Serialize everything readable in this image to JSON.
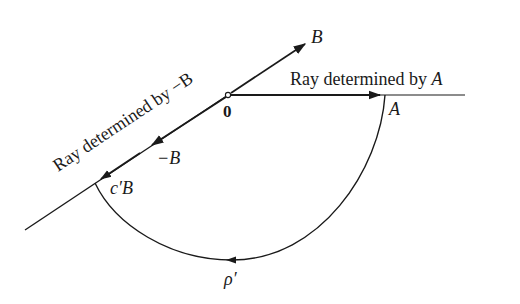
{
  "diagram": {
    "origin_label": "0",
    "vector_b_label": "B",
    "vector_neg_b_label": "−B",
    "point_a_label": "A",
    "point_cb_label": "c′B",
    "curve_label": "ρ′",
    "ray_a_caption": "Ray determined by ",
    "ray_a_var": "A",
    "ray_neg_b_caption": "Ray determined by −B",
    "colors": {
      "ink": "#1a1a1a",
      "background": "#ffffff"
    }
  }
}
